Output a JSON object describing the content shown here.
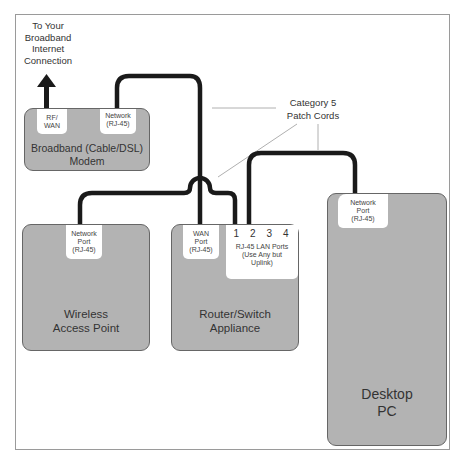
{
  "diagram": {
    "internet_label": [
      "To Your",
      "Broadband",
      "Internet",
      "Connection"
    ],
    "cable_label": [
      "Category 5",
      "Patch Cords"
    ],
    "colors": {
      "device_fill": "#b3b3b3",
      "cable": "#1a1a1a",
      "port_fill": "#ffffff",
      "frame": "#9a9a9a"
    },
    "devices": {
      "modem": {
        "label": [
          "Broadband (Cable/DSL)",
          "Modem"
        ],
        "ports": {
          "rf_wan": [
            "RF/",
            "WAN"
          ],
          "network": [
            "Network",
            "(RJ-45)"
          ]
        }
      },
      "access_point": {
        "label": [
          "Wireless",
          "Access Point"
        ],
        "ports": {
          "network": [
            "Network",
            "Port",
            "(RJ-45)"
          ]
        }
      },
      "router": {
        "label": [
          "Router/Switch",
          "Appliance"
        ],
        "ports": {
          "wan": [
            "WAN",
            "Port",
            "(RJ-45)"
          ],
          "lan_numbers": [
            "1",
            "2",
            "3",
            "4"
          ],
          "lan": [
            "RJ-45 LAN Ports",
            "(Use Any but",
            "Uplink)"
          ]
        }
      },
      "desktop": {
        "label": [
          "Desktop",
          "PC"
        ],
        "ports": {
          "network": [
            "Network",
            "Port",
            "(RJ-45)"
          ]
        }
      }
    }
  }
}
